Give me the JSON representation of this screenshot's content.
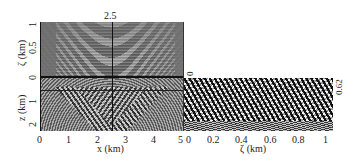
{
  "figure": {
    "top_panel": {
      "annotation": "2.5",
      "ylabel": "ζ (km)",
      "yticks": [
        "1",
        "0.5",
        "0"
      ]
    },
    "bottom_left_panel": {
      "ylabel": "z (km)",
      "yticks": [
        "1",
        "2"
      ],
      "xlabel": "x (km)",
      "xticks": [
        "0",
        "1",
        "2",
        "3",
        "4",
        "5"
      ]
    },
    "right_panel": {
      "top_tick": "0",
      "side_annotation": "0.62",
      "xlabel": "ζ (km)",
      "xticks": [
        "0",
        "0.2",
        "0.4",
        "0.6",
        "0.8",
        "1"
      ]
    }
  }
}
